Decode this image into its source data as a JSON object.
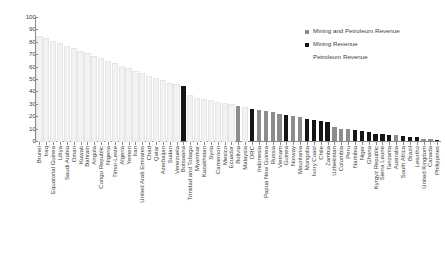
{
  "chart_data": {
    "type": "bar",
    "title": "",
    "xlabel": "",
    "ylabel": "",
    "ylim": [
      0,
      100
    ],
    "yticks": [
      100,
      90,
      80,
      70,
      60,
      50,
      40,
      30,
      20,
      10,
      0
    ],
    "grid": false,
    "legend_position": "top-right",
    "legend": [
      {
        "label": "Mining and Petroleum Revenue",
        "color": "#8c8c8c"
      },
      {
        "label": "Mining Revenue",
        "color": "#151515"
      },
      {
        "label": "Petroleum Revenue",
        "color": "#f2f2f2"
      }
    ],
    "categories": [
      "Brunei",
      "Iraq",
      "Equatorial Guinea",
      "Libya",
      "Saudi Arabia",
      "Oman",
      "Kuwait",
      "Bahrain",
      "Angola",
      "Congo Republic",
      "Nigeria",
      "Timor-Leste",
      "Algeria",
      "Yemen",
      "Iran",
      "United Arab Emirates",
      "Chad",
      "Qatar",
      "Azerbaijan",
      "Sudan",
      "Venezuela",
      "Botswana",
      "Trinidad and Tobago",
      "Myanmar",
      "Kazakhstan",
      "Syria",
      "Cameroon",
      "Mexico",
      "Ecuador",
      "Bolivia",
      "Malaysia",
      "DRC",
      "Indonesia",
      "Papua New Guinea",
      "Russia",
      "Vietnam",
      "Guinea",
      "Norway",
      "Mauritania",
      "Mongolia",
      "Ivory Coast",
      "Chile",
      "Zambia",
      "Uzbekistan",
      "Colombia",
      "Peru",
      "Namibia",
      "Niger",
      "Ghana",
      "Kyrgyz Republic",
      "Sierra Leone",
      "Tanzania",
      "Australia",
      "South Africa",
      "Brazil",
      "Lesotho",
      "United Kingdom",
      "Canada",
      "Philippines"
    ],
    "values": [
      84,
      82,
      80,
      78,
      76,
      74,
      72,
      70,
      68,
      66,
      64,
      62,
      60,
      58,
      56,
      54,
      52,
      50,
      48,
      46,
      45,
      44,
      36,
      34,
      33,
      32,
      31,
      30,
      29,
      28,
      27,
      26,
      25,
      24,
      23,
      22,
      21,
      20,
      19,
      18,
      17,
      16,
      15,
      11,
      10,
      9.5,
      9,
      8,
      7.5,
      6,
      5.5,
      5,
      4.5,
      4,
      3.5,
      3,
      2,
      1.5,
      1
    ],
    "series_type": [
      "petroleum",
      "petroleum",
      "petroleum",
      "petroleum",
      "petroleum",
      "petroleum",
      "petroleum",
      "petroleum",
      "petroleum",
      "petroleum",
      "petroleum",
      "petroleum",
      "petroleum",
      "petroleum",
      "petroleum",
      "petroleum",
      "petroleum",
      "petroleum",
      "petroleum",
      "petroleum",
      "petroleum",
      "mining",
      "petroleum",
      "petroleum",
      "petroleum",
      "petroleum",
      "petroleum",
      "petroleum",
      "petroleum",
      "both",
      "petroleum",
      "mining",
      "both",
      "both",
      "both",
      "both",
      "mining",
      "both",
      "both",
      "mining",
      "mining",
      "mining",
      "mining",
      "both",
      "both",
      "both",
      "mining",
      "mining",
      "mining",
      "mining",
      "mining",
      "mining",
      "both",
      "mining",
      "mining",
      "mining",
      "both",
      "both",
      "mining"
    ]
  }
}
